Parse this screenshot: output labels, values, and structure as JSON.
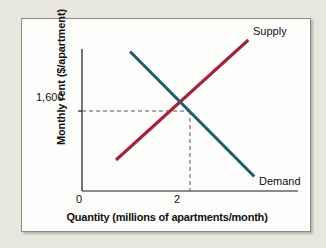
{
  "figure": {
    "background_color": "#e8e7dd",
    "panel_color": "#fdfdfb",
    "panel_border_color": "#8b8b83"
  },
  "chart_data": {
    "type": "line",
    "title": "",
    "subtitle": "",
    "xlabel": "Quantity (millions of apartments/month)",
    "ylabel": "Monthly rent ($/apartment)",
    "xlim": [
      0,
      4
    ],
    "ylim": [
      0,
      3200
    ],
    "grid": false,
    "legend_position": "inline-curve-end",
    "x_ticks": [
      "0",
      "2"
    ],
    "x_tick_values": [
      0,
      2
    ],
    "y_ticks": [
      "1,600"
    ],
    "y_tick_values": [
      1600
    ],
    "annotations": [
      {
        "name": "equilibrium-guides",
        "text": "",
        "x": 2,
        "y": 1600,
        "style": "dashed"
      }
    ],
    "series": [
      {
        "name": "Supply",
        "label": "Supply",
        "color": "#a5233a",
        "slope": "upward",
        "points": [
          {
            "x": 0.63,
            "y": 620
          },
          {
            "x": 3.08,
            "y": 3020
          }
        ]
      },
      {
        "name": "Demand",
        "label": "Demand",
        "color": "#1f5d6b",
        "slope": "downward",
        "points": [
          {
            "x": 0.89,
            "y": 2790
          },
          {
            "x": 3.19,
            "y": 290
          }
        ]
      }
    ],
    "equilibrium": {
      "quantity": 2,
      "price": 1600,
      "price_label": "1,600",
      "quantity_label": "2"
    }
  },
  "labels": {
    "y_axis": "Monthly rent ($/apartment)",
    "x_axis": "Quantity (millions of apartments/month)",
    "y_tick_1600": "1,600",
    "x_tick_0": "0",
    "x_tick_2": "2",
    "supply": "Supply",
    "demand": "Demand"
  }
}
